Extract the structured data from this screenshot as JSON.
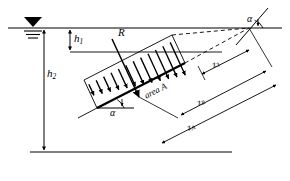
{
  "figure": {
    "background_color": "#ffffff",
    "line_color": "#000000",
    "width": 290,
    "height": 181
  },
  "labels": {
    "h1": {
      "text": "h",
      "sub": "1",
      "meaning": "depth-to-top-of-plate"
    },
    "h2": {
      "text": "h",
      "sub": "2",
      "meaning": "depth-to-bottom-of-plate"
    },
    "R": {
      "text": "R",
      "sub": "",
      "meaning": "resultant-pressure-force"
    },
    "area": {
      "text": "area ",
      "sub": "",
      "italic_symbol": "A",
      "full": "area A"
    },
    "z3": {
      "text": "z",
      "sub": "3",
      "meaning": "distance-along-plane-to-top-edge"
    },
    "zR": {
      "text": "z",
      "sub": "R",
      "meaning": "distance-along-plane-to-force-R"
    },
    "zA": {
      "text": "z",
      "sub": "A",
      "meaning": "distance-along-plane-to-centroid"
    },
    "alpha_top": {
      "text": "α",
      "meaning": "inclination-angle-at-free-surface"
    },
    "alpha_bottom": {
      "text": "α",
      "meaning": "inclination-angle-at-plate-bottom"
    }
  },
  "icons": {
    "water_surface": "water-level-triangle-icon",
    "pressure_arrows": "pressure-distribution-arrows-icon",
    "resultant_arrow": "resultant-force-arrow-icon"
  },
  "geometry": {
    "free_surface_y": 28,
    "bottom_line_y": 152,
    "plate_angle_degrees": 27,
    "pressure_arrow_count": 12
  }
}
